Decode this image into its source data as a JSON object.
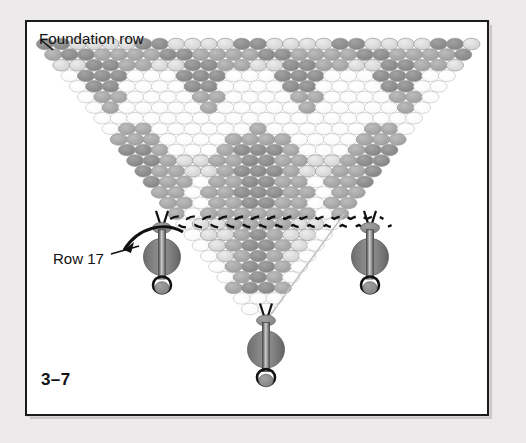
{
  "figure": {
    "id": "3-7",
    "id_label": "3–7",
    "type": "beadwork-netting-diagram",
    "caption_labels": {
      "foundation_row": "Foundation row",
      "row_17": "Row 17"
    }
  },
  "panel": {
    "background": "#ffffff",
    "border_color": "#1b1b1b",
    "page_background": "#eceaea"
  },
  "palette": {
    "bead_dark": "#8a8a8a",
    "bead_mid": "#a8a8a8",
    "bead_light": "#d9d9d9",
    "bead_empty": "#fdfdfd",
    "bead_outline": "#b0b0b0",
    "thread": "#111111",
    "accent_dark_bead": "#6f6f6f"
  },
  "chart_data": {
    "type": "grid",
    "rows": 26,
    "bead_shades": [
      "dark",
      "mid",
      "light",
      "empty"
    ],
    "legend": [
      {
        "name": "dark",
        "color": "#8a8a8a"
      },
      {
        "name": "mid",
        "color": "#a8a8a8"
      },
      {
        "name": "light",
        "color": "#d9d9d9"
      },
      {
        "name": "empty",
        "color": "#fdfdfd"
      }
    ],
    "annotations": [
      {
        "text": "Foundation row",
        "target": "top-left bead of row 1",
        "arrow": true
      },
      {
        "text": "Row 17",
        "target": "row 17 thread path",
        "arrow": true
      }
    ]
  },
  "pendants": [
    {
      "name": "left-pendant",
      "position": "left"
    },
    {
      "name": "center-pendant",
      "position": "center"
    },
    {
      "name": "right-pendant",
      "position": "right"
    }
  ]
}
